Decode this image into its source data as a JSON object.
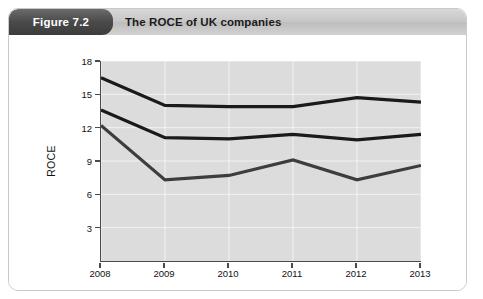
{
  "header": {
    "figure_badge": "Figure 7.2",
    "title": "The ROCE of UK companies"
  },
  "chart_data": {
    "type": "line",
    "title": "The ROCE of UK companies",
    "xlabel": "",
    "ylabel": "ROCE",
    "categories": [
      "2008",
      "2009",
      "2010",
      "2011",
      "2012",
      "2013"
    ],
    "x": [
      2008,
      2009,
      2010,
      2011,
      2012,
      2013
    ],
    "ylim": [
      0,
      18
    ],
    "xlim": [
      2008,
      2013
    ],
    "yticks": [
      3,
      6,
      9,
      12,
      15,
      18
    ],
    "ytick_labels": [
      "3",
      "6",
      "9",
      "12",
      "15",
      "18"
    ],
    "xtick_labels": [
      "2008",
      "2009",
      "2010",
      "2011",
      "2012",
      "2013"
    ],
    "grid": true,
    "legend": "annotations-inline",
    "plot_background": "#dcdcdc",
    "series": [
      {
        "name": "Service companies",
        "color": "#1a1a1a",
        "values": [
          16.5,
          14.0,
          13.9,
          13.9,
          14.7,
          14.3
        ]
      },
      {
        "name": "All non-financial companies",
        "color": "#1a1a1a",
        "values": [
          13.6,
          11.1,
          11.0,
          11.4,
          10.9,
          11.4
        ]
      },
      {
        "name": "Manufacturing companies",
        "color": "#3d3d3d",
        "values": [
          12.2,
          7.3,
          7.7,
          9.1,
          7.3,
          8.6
        ]
      }
    ],
    "annotations": [
      {
        "id": "service",
        "line1": "Service",
        "line2": "companies",
        "x": 2011.0,
        "y": 16.6
      },
      {
        "id": "non-financial",
        "line1": "All non-financial",
        "line2": "companies",
        "x": 2009.45,
        "y": 12.5
      },
      {
        "id": "manufacturing",
        "line1": "Manufacturing",
        "line2": "companies",
        "x": 2010.75,
        "y": 6.0
      }
    ]
  }
}
